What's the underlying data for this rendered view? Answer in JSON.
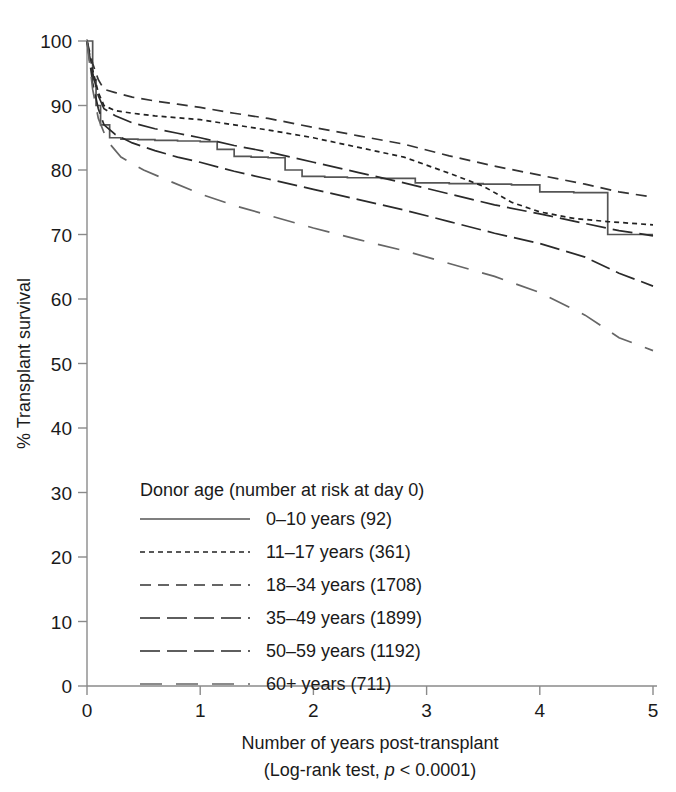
{
  "chart_data": {
    "type": "line",
    "title": "",
    "xlabel": "Number of years post-transplant",
    "xlabel_sub_prefix": "(Log-rank test, ",
    "xlabel_sub_italic": "p",
    "xlabel_sub_suffix": " < 0.0001)",
    "ylabel": "% Transplant survival",
    "xlim": [
      0,
      5
    ],
    "ylim": [
      0,
      100
    ],
    "xticks": [
      "0",
      "1",
      "2",
      "3",
      "4",
      "5"
    ],
    "xtick_values": [
      0,
      1,
      2,
      3,
      4,
      5
    ],
    "yticks": [
      "0",
      "10",
      "20",
      "30",
      "40",
      "50",
      "60",
      "70",
      "80",
      "90",
      "100"
    ],
    "ytick_values": [
      0,
      10,
      20,
      30,
      40,
      50,
      60,
      70,
      80,
      90,
      100
    ],
    "grid": false,
    "legend_position": "inside-lower-left",
    "legend_title": "Donor age (number at risk at day 0)",
    "series": [
      {
        "name": "0–10 years (92)",
        "label": "0–10 years (92)",
        "n_at_risk": 92,
        "style": "solid",
        "dash": "none",
        "step": true,
        "color": "#555555",
        "x": [
          0,
          0.05,
          0.08,
          0.12,
          0.2,
          0.3,
          0.45,
          0.6,
          0.8,
          1.0,
          1.15,
          1.3,
          1.45,
          1.6,
          1.75,
          1.9,
          2.1,
          2.3,
          2.6,
          2.9,
          3.2,
          3.5,
          3.75,
          4.0,
          4.3,
          4.6,
          5.0
        ],
        "y": [
          100,
          94,
          90,
          87,
          85,
          84.8,
          84.7,
          84.6,
          84.5,
          84.4,
          83.2,
          82.1,
          82.0,
          81.9,
          80.0,
          79.0,
          78.9,
          78.8,
          78.7,
          78.0,
          77.9,
          77.8,
          77.7,
          76.6,
          76.5,
          70.0,
          70.0
        ]
      },
      {
        "name": "11–17 years (361)",
        "label": "11–17 years (361)",
        "n_at_risk": 361,
        "style": "dotted",
        "dash": "5,4",
        "step": false,
        "color": "#222222",
        "x": [
          0,
          0.05,
          0.1,
          0.15,
          0.25,
          0.4,
          0.6,
          0.8,
          1.0,
          1.3,
          1.6,
          2.0,
          2.4,
          2.8,
          3.2,
          3.5,
          3.75,
          4.0,
          4.3,
          4.6,
          5.0
        ],
        "y": [
          100,
          95.5,
          92.0,
          90.0,
          89.2,
          88.8,
          88.4,
          88.1,
          87.8,
          87.0,
          86.2,
          85.0,
          83.5,
          82.0,
          79.5,
          77.5,
          75.0,
          73.5,
          72.5,
          72.0,
          71.5
        ]
      },
      {
        "name": "18–34 years (1708)",
        "label": "18–34 years (1708)",
        "n_at_risk": 1708,
        "style": "dashed",
        "dash": "11,7",
        "step": false,
        "color": "#333333",
        "x": [
          0,
          0.05,
          0.1,
          0.15,
          0.25,
          0.4,
          0.6,
          0.8,
          1.0,
          1.3,
          1.6,
          2.0,
          2.4,
          2.8,
          3.2,
          3.6,
          4.0,
          4.4,
          4.7,
          5.0
        ],
        "y": [
          100,
          96.5,
          94.0,
          92.5,
          92.0,
          91.3,
          90.7,
          90.2,
          89.7,
          88.8,
          88.0,
          86.6,
          85.3,
          84.0,
          82.2,
          80.6,
          79.2,
          77.8,
          76.6,
          75.8
        ]
      },
      {
        "name": "35–49 years (1899)",
        "label": "35–49 years (1899)",
        "n_at_risk": 1899,
        "style": "long-dash",
        "dash": "20,7",
        "step": false,
        "color": "#2a2a2a",
        "x": [
          0,
          0.05,
          0.1,
          0.15,
          0.25,
          0.4,
          0.6,
          0.8,
          1.0,
          1.3,
          1.6,
          2.0,
          2.4,
          2.8,
          3.2,
          3.6,
          4.0,
          4.4,
          4.7,
          5.0
        ],
        "y": [
          100,
          95.0,
          91.5,
          89.5,
          88.4,
          87.3,
          86.4,
          85.7,
          85.0,
          83.8,
          82.8,
          81.2,
          79.6,
          78.0,
          76.3,
          74.6,
          73.2,
          71.7,
          70.6,
          69.8
        ]
      },
      {
        "name": "50–59 years (1192)",
        "label": "50–59 years (1192)",
        "n_at_risk": 1192,
        "style": "long-dash",
        "dash": "20,7",
        "step": false,
        "color": "#2a2a2a",
        "x": [
          0,
          0.05,
          0.1,
          0.15,
          0.25,
          0.4,
          0.6,
          0.8,
          1.0,
          1.3,
          1.6,
          2.0,
          2.4,
          2.8,
          3.2,
          3.6,
          4.0,
          4.4,
          4.7,
          5.0
        ],
        "y": [
          100,
          93.5,
          89.5,
          87.0,
          85.5,
          84.2,
          83.0,
          82.0,
          81.2,
          79.8,
          78.6,
          77.0,
          75.4,
          73.8,
          72.0,
          70.2,
          68.6,
          66.5,
          64.0,
          62.0
        ]
      },
      {
        "name": "60+ years (711)",
        "label": "60+ years (711)",
        "n_at_risk": 711,
        "style": "wide-gap-dash",
        "dash": "22,14",
        "step": false,
        "color": "#666666",
        "x": [
          0,
          0.05,
          0.1,
          0.18,
          0.3,
          0.5,
          0.7,
          1.0,
          1.3,
          1.6,
          2.0,
          2.4,
          2.8,
          3.2,
          3.6,
          4.0,
          4.4,
          4.7,
          5.0
        ],
        "y": [
          100,
          92.5,
          88.0,
          84.5,
          82.0,
          80.0,
          78.5,
          76.3,
          74.5,
          73.0,
          71.0,
          69.2,
          67.5,
          65.5,
          63.5,
          61.0,
          57.5,
          54.0,
          52.0
        ]
      }
    ]
  }
}
